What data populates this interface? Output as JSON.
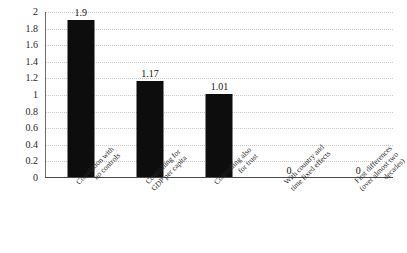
{
  "chart_data": {
    "type": "bar",
    "title": "",
    "xlabel": "",
    "ylabel": "",
    "ylim": [
      0,
      2
    ],
    "grid": true,
    "legend": false,
    "bar_color": "#0d0d0d",
    "gridline_color": "#c9c9c9",
    "axis_color": "#4a4a4a",
    "yticks": [
      "0",
      "0.2",
      "0.4",
      "0.6",
      "0.8",
      "1",
      "1.2",
      "1.4",
      "1.6",
      "1.8",
      "2"
    ],
    "ytick_values": [
      0,
      0.2,
      0.4,
      0.6,
      0.8,
      1,
      1.2,
      1.4,
      1.6,
      1.8,
      2
    ],
    "categories": [
      "Correlation with no controls",
      "Controlling for GDP per capita",
      "Controlling also for trust",
      "With country and time fixed effects",
      "First differences (over almost two decades)"
    ],
    "category_lines": [
      [
        "Correlation with",
        "no controls"
      ],
      [
        "Controlling for",
        "GDP per capita"
      ],
      [
        "Controlling also",
        "for trust"
      ],
      [
        "With country and",
        "time fixed effects"
      ],
      [
        "First differences",
        "(over almost two",
        "decades)"
      ]
    ],
    "values": [
      1.9,
      1.17,
      1.01,
      0,
      0
    ],
    "value_labels": [
      "1.9",
      "1.17",
      "1.01",
      "0",
      "0"
    ]
  }
}
